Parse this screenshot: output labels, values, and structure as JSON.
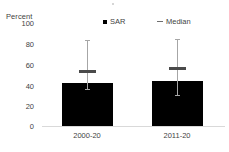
{
  "chart_data": {
    "type": "bar",
    "title": "",
    "subtitle": "",
    "xlabel": "",
    "ylabel": "Percent",
    "ylim": [
      0,
      100
    ],
    "yticks": [
      100,
      80,
      60,
      40,
      20,
      0
    ],
    "grid": false,
    "legend_position": "top-center",
    "categories": [
      "2000-20",
      "2011-20"
    ],
    "series": [
      {
        "name": "SAR",
        "marker": "filled-square",
        "color": "#000000",
        "values": [
          41,
          43
        ]
      },
      {
        "name": "Median",
        "marker": "dash",
        "color": "#4a4a4a",
        "values": [
          51,
          54
        ]
      }
    ],
    "error_bars": {
      "color": "#a6a6a6",
      "upper": [
        82,
        83
      ],
      "lower": [
        35,
        29
      ]
    },
    "annotations": []
  },
  "axis": {
    "y_title": "Percent",
    "y_ticks": [
      "100",
      "80",
      "60",
      "40",
      "20",
      "0"
    ],
    "x_ticks": [
      "2000-20",
      "2011-20"
    ]
  },
  "legend": {
    "items": [
      {
        "label": "SAR",
        "marker": "filled-square"
      },
      {
        "label": "Median",
        "marker": "dash"
      }
    ]
  }
}
